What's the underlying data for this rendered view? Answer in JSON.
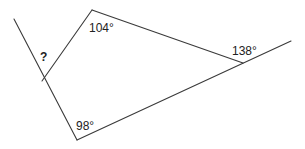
{
  "diagram": {
    "type": "geometry-angles",
    "stroke_color": "#3a3a3a",
    "text_color": "#222222",
    "segments": [
      {
        "id": "left-ray",
        "x1": 14,
        "y1": 19,
        "x2": 77,
        "y2": 140
      },
      {
        "id": "inner-left-side",
        "x1": 42,
        "y1": 81,
        "x2": 92,
        "y2": 10
      },
      {
        "id": "top-side",
        "x1": 92,
        "y1": 10,
        "x2": 243,
        "y2": 63
      },
      {
        "id": "bottom-ray",
        "x1": 77,
        "y1": 140,
        "x2": 291,
        "y2": 41
      }
    ],
    "labels": {
      "unknown": "?",
      "top_angle": "104°",
      "right_angle": "138°",
      "bottom_angle": "98°"
    }
  }
}
